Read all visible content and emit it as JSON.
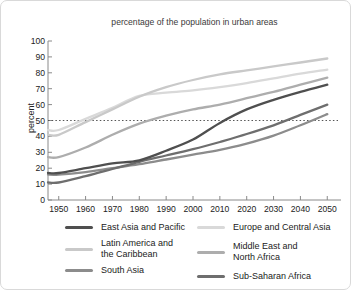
{
  "chart_data": {
    "type": "line",
    "title": "percentage of the population in urban areas",
    "ylabel": "percent",
    "xlabel": "",
    "xlim": [
      1946,
      2054
    ],
    "ylim": [
      0,
      100
    ],
    "x_ticks": [
      1950,
      1960,
      1970,
      1980,
      1990,
      2000,
      2010,
      2020,
      2030,
      2040,
      2050
    ],
    "y_ticks": [
      0,
      10,
      20,
      30,
      40,
      50,
      60,
      70,
      80,
      90,
      100
    ],
    "grid": false,
    "legend_position": "bottom",
    "reference_line": {
      "y": 50,
      "style": "dotted",
      "color": "#555555"
    },
    "x": [
      1950,
      1960,
      1970,
      1980,
      1990,
      2000,
      2010,
      2020,
      2030,
      2040,
      2050
    ],
    "series": [
      {
        "name": "East Asia and Pacific",
        "color": "#4f4f4f",
        "values": [
          17,
          20,
          23,
          25,
          31,
          38,
          48.5,
          57,
          63,
          68,
          72.5
        ]
      },
      {
        "name": "Latin America and the Caribbean",
        "color": "#c9c9c9",
        "values": [
          41,
          49,
          57,
          65,
          71,
          75.5,
          79,
          81.5,
          84,
          86.5,
          89
        ]
      },
      {
        "name": "South Asia",
        "color": "#8c8c8c",
        "values": [
          16,
          17.5,
          20,
          22.5,
          25.5,
          28.5,
          31.5,
          35.5,
          40.5,
          47,
          54
        ]
      },
      {
        "name": "Europe and Central Asia",
        "color": "#d9d9d9",
        "values": [
          44,
          51,
          58,
          65.5,
          67.5,
          69,
          71,
          73.5,
          76.5,
          79.5,
          82
        ]
      },
      {
        "name": "Middle East and North Africa",
        "color": "#adadad",
        "values": [
          27,
          33,
          41,
          48,
          53,
          57,
          60,
          64,
          68,
          72.5,
          77
        ]
      },
      {
        "name": "Sub-Saharan Africa",
        "color": "#6e6e6e",
        "values": [
          11,
          15,
          19.5,
          24,
          28,
          32,
          36.5,
          41.5,
          47,
          53.5,
          60
        ]
      }
    ],
    "draw_order": [
      "Europe and Central Asia",
      "Latin America and the Caribbean",
      "Middle East and North Africa",
      "South Asia",
      "Sub-Saharan Africa",
      "East Asia and Pacific"
    ]
  },
  "legend": {
    "columns": [
      [
        "East Asia and Pacific",
        "Latin America and the Caribbean",
        "South Asia"
      ],
      [
        "Europe and Central Asia",
        "Middle East and North Africa",
        "Sub-Saharan Africa"
      ]
    ]
  },
  "axis_color": "#8a8a8a",
  "card": {
    "background": "#ffffff",
    "border": "#d9d9d9"
  }
}
